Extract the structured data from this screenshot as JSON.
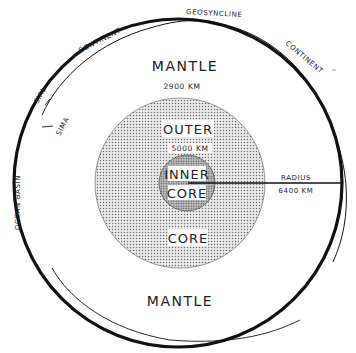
{
  "diagram": {
    "title": "",
    "layers": {
      "mantle_top_label": "MANTLE",
      "mantle_bottom_label": "MANTLE",
      "outer_core_label_top": "OUTER",
      "outer_core_label_bottom": "CORE",
      "inner_core_label_top": "INNER",
      "inner_core_label_bottom": "CORE"
    },
    "depths": {
      "core_boundary": "2900 KM",
      "inner_core_boundary": "5000 KM"
    },
    "radius": {
      "label": "RADIUS",
      "value": "6400 KM"
    },
    "crust_labels": {
      "continent_left": "CONTINENT",
      "continent_right": "CONTINENT",
      "geosyncline": "GEOSYNCLINE",
      "sial": "SIAL",
      "sima": "SIMA",
      "ocean_basin": "OCEAN BASIN"
    },
    "colors": {
      "ink": "#111111",
      "outer_core_fill": "#e4e4e4",
      "inner_core_fill": "#bdbdbd",
      "background": "#ffffff"
    }
  }
}
